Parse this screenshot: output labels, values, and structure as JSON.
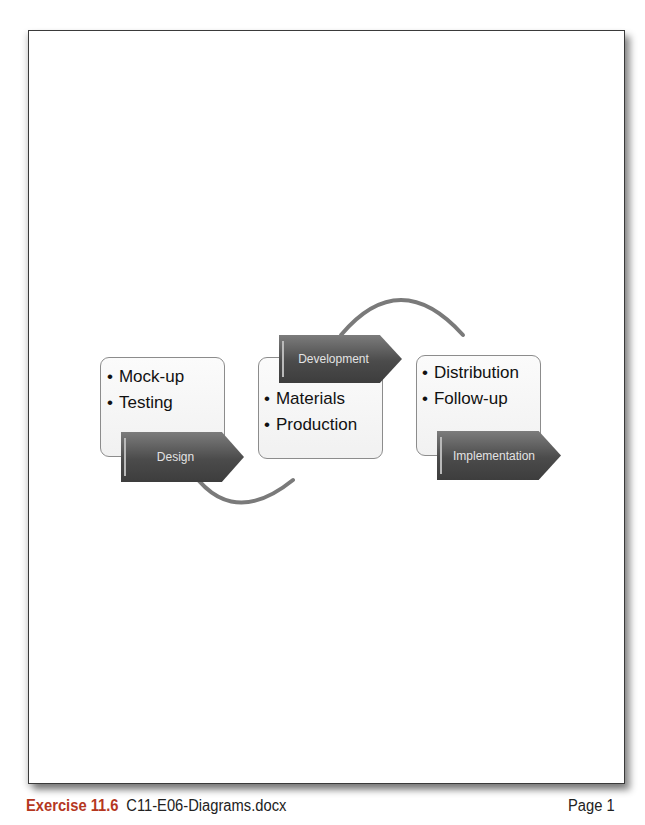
{
  "diagram": {
    "steps": [
      {
        "label": "Design",
        "bullets": [
          "Mock-up",
          "Testing"
        ]
      },
      {
        "label": "Development",
        "bullets": [
          "Materials",
          "Production"
        ]
      },
      {
        "label": "Implementation",
        "bullets": [
          "Distribution",
          "Follow-up"
        ]
      }
    ],
    "colors": {
      "arrow_fill": "#4b4b4b",
      "arrow_text": "#e3e3e3",
      "box_border": "#8c8c8c",
      "connector": "#7a7a7a"
    }
  },
  "footer": {
    "exercise": "Exercise 11.6",
    "filename": "C11-E06-Diagrams.docx",
    "page": "Page 1"
  }
}
